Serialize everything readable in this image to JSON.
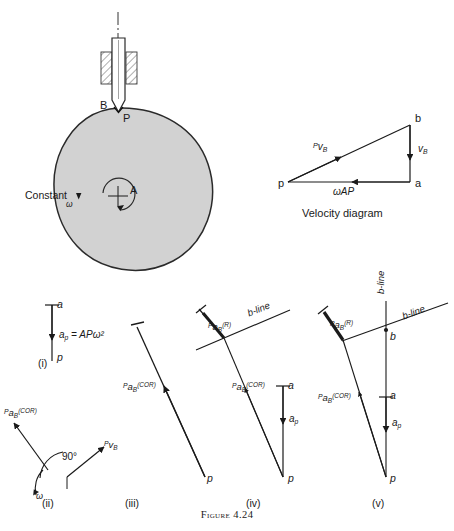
{
  "figure": {
    "caption": "Figure 4.24",
    "caption_x": 0,
    "caption_y": 509,
    "caption_size": 10
  },
  "colors": {
    "ink": "#1a1a1a",
    "cam_fill": "#d2d2d2",
    "cam_stroke": "#2a2a2a",
    "hatch": "#6a6a6a",
    "paper": "#ffffff"
  },
  "mechanism": {
    "name": "cam-with-knife-edge-follower",
    "cam": {
      "label_center": "A",
      "label_contact_cam": "P",
      "label_contact_follower": "B",
      "omega_text": "Constant",
      "omega_symbol": "ω"
    },
    "follower": {
      "name": "knife-edge-follower-in-guide"
    }
  },
  "velocity_diagram": {
    "title": "Velocity diagram",
    "pole": "p",
    "nodes": [
      {
        "name": "p",
        "label": "p",
        "x": 288,
        "y": 182
      },
      {
        "name": "a",
        "label": "a",
        "x": 410,
        "y": 182
      },
      {
        "name": "b",
        "label": "b",
        "x": 410,
        "y": 125
      }
    ],
    "vectors": [
      {
        "name": "rel-velocity-P-B",
        "from": "p",
        "to": "b",
        "label_pre": "P",
        "label_main": "v",
        "label_sub": "B"
      },
      {
        "name": "velocity-B",
        "from": "b",
        "to": "a",
        "label_pre": "",
        "label_main": "v",
        "label_sub": "B"
      },
      {
        "name": "velocity-A-P",
        "from": "a",
        "to": "p",
        "label_pre": "",
        "label_main": "ωAP",
        "label_sub": ""
      }
    ]
  },
  "acceleration_diagrams": [
    {
      "key": "i",
      "tag": "(i)",
      "tag_x": 38,
      "tag_y": 364,
      "nodes": [
        {
          "label": "a",
          "x": 52,
          "y": 305
        },
        {
          "label": "p",
          "x": 52,
          "y": 361
        }
      ],
      "vectors": [
        {
          "name": "centripetal-a-p",
          "label_pre": "",
          "label_main": "a",
          "label_sub": "p",
          "equation": " = APω²"
        }
      ]
    },
    {
      "key": "ii",
      "tag": "(ii)",
      "tag_x": 42,
      "tag_y": 494,
      "angle_label": "90°",
      "omega_symbol": "ω",
      "vectors": [
        {
          "name": "coriolis-direction",
          "label_pre": "P",
          "label_main": "a",
          "label_sub": "B",
          "label_sup": "(COR)"
        },
        {
          "name": "relative-velocity-direction",
          "label_pre": "P",
          "label_main": "v",
          "label_sub": "B",
          "label_sup": ""
        }
      ]
    },
    {
      "key": "iii",
      "tag": "(iii)",
      "tag_x": 125,
      "tag_y": 494,
      "nodes": [
        {
          "label": "p",
          "x": 205,
          "y": 477
        }
      ],
      "vectors": [
        {
          "name": "coriolis-component",
          "label_pre": "P",
          "label_main": "a",
          "label_sub": "B",
          "label_sup": "(COR)"
        }
      ]
    },
    {
      "key": "iv",
      "tag": "(iv)",
      "tag_x": 246,
      "tag_y": 494,
      "nodes": [
        {
          "label": "a",
          "x": 283,
          "y": 386
        },
        {
          "label": "p",
          "x": 283,
          "y": 477
        }
      ],
      "vectors": [
        {
          "name": "centripetal-a-p",
          "label_pre": "",
          "label_main": "a",
          "label_sub": "p",
          "label_sup": ""
        }
      ]
    },
    {
      "key": "v",
      "tag": "(v)",
      "tag_x": 372,
      "tag_y": 494,
      "nodes": [
        {
          "label": "b",
          "x": 386,
          "y": 330
        },
        {
          "label": "a",
          "x": 386,
          "y": 397
        },
        {
          "label": "p",
          "x": 386,
          "y": 477
        }
      ],
      "bline_label_1": "b-line",
      "bline_label_2": "b-line",
      "vectors": [
        {
          "name": "radial-component",
          "label_pre": "P",
          "label_main": "a",
          "label_sub": "B",
          "label_sup": "(R)"
        },
        {
          "name": "coriolis-component",
          "label_pre": "P",
          "label_main": "a",
          "label_sub": "B",
          "label_sup": "(COR)"
        },
        {
          "name": "centripetal-a-p",
          "label_pre": "",
          "label_main": "a",
          "label_sub": "p",
          "label_sup": ""
        }
      ]
    }
  ],
  "shared_labels": {
    "bline": "b-line",
    "cor_sup": "(COR)",
    "r_sup": "(R)"
  }
}
